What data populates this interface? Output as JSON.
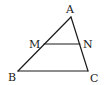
{
  "diagram": {
    "points": {
      "A": {
        "label": "A",
        "x": 71,
        "y": 17
      },
      "B": {
        "label": "B",
        "x": 18,
        "y": 71
      },
      "C": {
        "label": "C",
        "x": 88,
        "y": 71
      },
      "M": {
        "label": "M",
        "x": 44,
        "y": 44
      },
      "N": {
        "label": "N",
        "x": 80,
        "y": 44
      }
    },
    "segments": [
      "AB",
      "AC",
      "BC",
      "MN"
    ],
    "colors": {
      "stroke": "#1a1a1a",
      "background": "#ffffff"
    }
  }
}
